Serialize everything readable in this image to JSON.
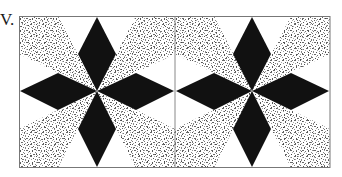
{
  "figure": {
    "label": "V.",
    "tile_count": 2,
    "colors": {
      "diamond": "#111111",
      "background": "#ffffff",
      "speckle_dark": "#555555",
      "speckle_light": "#9a9a9a",
      "border": "#777777"
    },
    "frame": {
      "x": 19,
      "y": 16,
      "width": 311,
      "height": 152
    },
    "tiles": [
      {
        "name": "left-block",
        "x": 19,
        "y": 16,
        "width": 156,
        "height": 152,
        "center": [
          97,
          91
        ]
      },
      {
        "name": "right-block",
        "x": 175,
        "y": 16,
        "width": 155,
        "height": 152,
        "center": [
          252,
          91
        ]
      }
    ]
  }
}
